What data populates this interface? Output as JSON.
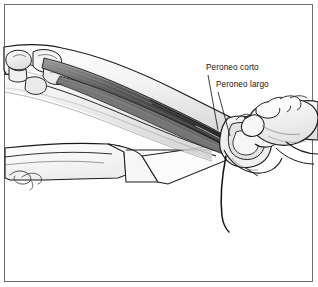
{
  "figure": {
    "background_color": "#ffffff",
    "border_color": "#6e6e6e",
    "ink_color": "#1a1a1a"
  },
  "labels": [
    {
      "id": "peroneo-corto",
      "text": "Peroneo corto",
      "leader": "vertical line descending from label to the peroneus brevis tendon at the lateral malleolus"
    },
    {
      "id": "peroneo-largo",
      "text": "Peroneo largo",
      "leader": "vertical line descending from label to the peroneus longus tendon behind the lateral malleolus"
    }
  ],
  "signature": {
    "text": "R. Day",
    "description": "artist signature in script at lower left of drape"
  },
  "anatomy": {
    "parts": [
      "fibular head",
      "tibia shaft",
      "fibula shaft",
      "peroneus longus muscle belly",
      "peroneus brevis muscle belly",
      "peroneal tendons",
      "lateral malleolus",
      "calcaneus",
      "fifth metatarsal base",
      "surgeon hand",
      "surgical drape",
      "tendon graft strand"
    ]
  },
  "shading": {
    "skin_light": "#f2f2f2",
    "skin_mid": "#dcdcdc",
    "muscle_dark": "#4a4a4a",
    "muscle_mid": "#8a8a8a",
    "bone_light": "#ededed",
    "drape_fill": "#fbfbfb",
    "drape_shadow": "#e3e3e3"
  }
}
